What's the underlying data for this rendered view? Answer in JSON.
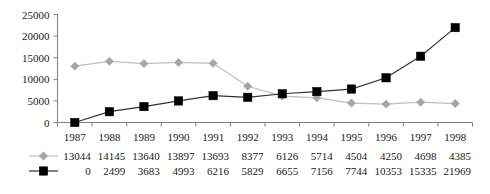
{
  "chart_data": {
    "type": "line",
    "title": "",
    "xlabel": "",
    "ylabel": "",
    "categories": [
      "1987",
      "1988",
      "1989",
      "1990",
      "1991",
      "1992",
      "1993",
      "1994",
      "1995",
      "1996",
      "1997",
      "1998"
    ],
    "series": [
      {
        "name": "series-1",
        "marker": "diamond",
        "color": "#a6a6a6",
        "line_color": "#bfbfbf",
        "values": [
          13044,
          14145,
          13640,
          13897,
          13693,
          8377,
          6126,
          5714,
          4504,
          4250,
          4698,
          4385
        ]
      },
      {
        "name": "series-2",
        "marker": "square",
        "color": "#000000",
        "line_color": "#333333",
        "values": [
          0,
          2499,
          3683,
          4993,
          6216,
          5829,
          6655,
          7156,
          7744,
          10353,
          15335,
          21969
        ]
      }
    ],
    "ylim": [
      0,
      25000
    ],
    "ytick_values": [
      0,
      5000,
      10000,
      15000,
      20000,
      25000
    ],
    "ytick_labels": [
      "0",
      "5000",
      "10000",
      "15000",
      "20000",
      "25000"
    ],
    "grid": false,
    "legend_position": "bottom-table"
  },
  "data_table": {
    "rows": [
      {
        "marker": "diamond",
        "color": "#a6a6a6",
        "values": [
          "13044",
          "14145",
          "13640",
          "13897",
          "13693",
          "8377",
          "6126",
          "5714",
          "4504",
          "4250",
          "4698",
          "4385"
        ]
      },
      {
        "marker": "square",
        "color": "#000000",
        "values": [
          "0",
          "2499",
          "3683",
          "4993",
          "6216",
          "5829",
          "6655",
          "7156",
          "7744",
          "10353",
          "15335",
          "21969"
        ]
      }
    ]
  }
}
